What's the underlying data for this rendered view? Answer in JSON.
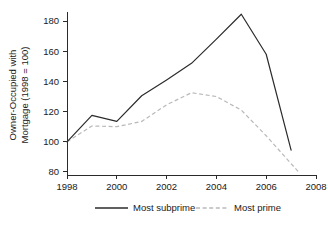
{
  "chart_data": {
    "type": "line",
    "title": "",
    "xlabel": "",
    "ylabel": "Owner-Occupied with Mortgage (1998 = 100)",
    "ylabel_line1": "Owner-Occupied with",
    "ylabel_line2": "Mortgage (1998 = 100)",
    "x": [
      1998,
      1999,
      2000,
      2001,
      2002,
      2003,
      2004,
      2005,
      2006,
      2007
    ],
    "xlim": [
      1998,
      2008
    ],
    "ylim": [
      78,
      186
    ],
    "xticks": [
      1998,
      2000,
      2002,
      2004,
      2006,
      2008
    ],
    "xtick_labels": [
      "1998",
      "2000",
      "2002",
      "2004",
      "2006",
      "2008"
    ],
    "yticks": [
      80,
      100,
      120,
      140,
      160,
      180
    ],
    "ytick_labels": [
      "80",
      "100",
      "120",
      "140",
      "160",
      "180"
    ],
    "grid": false,
    "legend_position": "below",
    "series": [
      {
        "name": "Most subprime",
        "style": "solid",
        "color": "#2b2b2b",
        "x": [
          1998,
          1999,
          2000,
          2001,
          2002,
          2003,
          2004,
          2005,
          2006,
          2007
        ],
        "values": [
          100,
          117.5,
          113.5,
          130.5,
          141,
          152,
          168,
          184.5,
          158,
          94.5
        ]
      },
      {
        "name": "Most prime",
        "style": "dashed",
        "color": "#b9b9b9",
        "x": [
          1998,
          1999,
          2000,
          2001,
          2002,
          2003,
          2004,
          2005,
          2006,
          2007,
          2007.3
        ],
        "values": [
          100,
          110.5,
          110,
          113.5,
          124.5,
          132.5,
          130,
          121,
          104,
          85.5,
          80
        ]
      }
    ]
  },
  "legend": {
    "items": [
      {
        "label": "Most subprime",
        "style": "solid",
        "color": "#2b2b2b"
      },
      {
        "label": "Most prime",
        "style": "dashed",
        "color": "#b9b9b9"
      }
    ]
  },
  "colors": {
    "axis": "#2b2b2b",
    "subprime": "#2b2b2b",
    "prime": "#b9b9b9",
    "background": "#ffffff",
    "text": "#1a1a1a"
  }
}
